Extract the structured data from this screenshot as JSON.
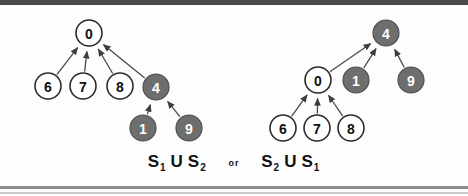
{
  "figure": {
    "background": "#fdfdfd",
    "border_color": "#4a4a4a",
    "colors": {
      "node_fill_white": "#ffffff",
      "node_fill_gray": "#6e6e6e",
      "node_stroke": "#2b2b2b",
      "edge": "#4a4a4a",
      "label_dark": "#111111",
      "label_light": "#ffffff"
    }
  },
  "diagrams": [
    {
      "id": "left-tree",
      "name": "S1 union S2",
      "root": "0",
      "nodes": [
        {
          "id": "L0",
          "label": "0",
          "fill": "white",
          "cx": 89,
          "cy": 33,
          "r": 13
        },
        {
          "id": "L6",
          "label": "6",
          "fill": "white",
          "cx": 48,
          "cy": 86,
          "r": 13
        },
        {
          "id": "L7",
          "label": "7",
          "fill": "white",
          "cx": 83,
          "cy": 86,
          "r": 13
        },
        {
          "id": "L8",
          "label": "8",
          "fill": "white",
          "cx": 120,
          "cy": 86,
          "r": 13
        },
        {
          "id": "L4",
          "label": "4",
          "fill": "gray",
          "cx": 156,
          "cy": 87,
          "r": 13
        },
        {
          "id": "L1",
          "label": "1",
          "fill": "gray",
          "cx": 143,
          "cy": 128,
          "r": 13
        },
        {
          "id": "L9",
          "label": "9",
          "fill": "gray",
          "cx": 189,
          "cy": 128,
          "r": 13
        }
      ],
      "edges": [
        {
          "from": "L6",
          "to": "L0"
        },
        {
          "from": "L7",
          "to": "L0"
        },
        {
          "from": "L8",
          "to": "L0"
        },
        {
          "from": "L4",
          "to": "L0"
        },
        {
          "from": "L1",
          "to": "L4"
        },
        {
          "from": "L9",
          "to": "L4"
        }
      ]
    },
    {
      "id": "right-tree",
      "name": "S2 union S1",
      "root": "4",
      "nodes": [
        {
          "id": "R4",
          "label": "4",
          "fill": "gray",
          "cx": 386,
          "cy": 33,
          "r": 13
        },
        {
          "id": "R0",
          "label": "0",
          "fill": "white",
          "cx": 318,
          "cy": 80,
          "r": 13
        },
        {
          "id": "R1",
          "label": "1",
          "fill": "gray",
          "cx": 356,
          "cy": 80,
          "r": 13
        },
        {
          "id": "R9",
          "label": "9",
          "fill": "gray",
          "cx": 411,
          "cy": 80,
          "r": 13
        },
        {
          "id": "R6",
          "label": "6",
          "fill": "white",
          "cx": 283,
          "cy": 128,
          "r": 13
        },
        {
          "id": "R7",
          "label": "7",
          "fill": "white",
          "cx": 317,
          "cy": 128,
          "r": 13
        },
        {
          "id": "R8",
          "label": "8",
          "fill": "white",
          "cx": 351,
          "cy": 128,
          "r": 13
        }
      ],
      "edges": [
        {
          "from": "R0",
          "to": "R4"
        },
        {
          "from": "R1",
          "to": "R4"
        },
        {
          "from": "R9",
          "to": "R4"
        },
        {
          "from": "R6",
          "to": "R0"
        },
        {
          "from": "R7",
          "to": "R0"
        },
        {
          "from": "R8",
          "to": "R0"
        }
      ]
    }
  ],
  "caption": {
    "left_set": "S",
    "left_set_sub": "1",
    "left_union": "U",
    "left_set2": "S",
    "left_set2_sub": "2",
    "or_word": "or",
    "right_set": "S",
    "right_set_sub": "2",
    "right_union": "U",
    "right_set2": "S",
    "right_set2_sub": "1"
  }
}
